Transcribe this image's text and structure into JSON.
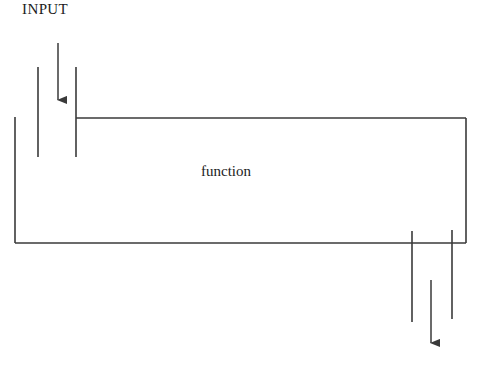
{
  "canvas": {
    "width": 481,
    "height": 378,
    "background": "#ffffff"
  },
  "style": {
    "stroke_color": "#3a3a3a",
    "text_color": "#1c1c1c",
    "stroke_width": 1.6
  },
  "labels": {
    "input": "INPUT",
    "function": "function"
  },
  "diagram": {
    "type": "block-flow-diagram",
    "box": {
      "name": "function-box",
      "left": 15,
      "top": 118,
      "right": 466,
      "bottom": 243
    },
    "arrows": [
      {
        "name": "input-arrow",
        "direction": "down",
        "x": 58,
        "y_start": 43,
        "y_end": 110
      },
      {
        "name": "output-arrow",
        "direction": "down",
        "x": 431,
        "y_start": 280,
        "y_end": 353
      }
    ],
    "port_lines": [
      {
        "name": "input-port-line-left",
        "x": 38,
        "y_start": 67,
        "y_end": 157
      },
      {
        "name": "input-port-line-right",
        "x": 76,
        "y_start": 67,
        "y_end": 157
      },
      {
        "name": "output-port-line-left",
        "x": 412,
        "y_start": 231,
        "y_end": 322
      },
      {
        "name": "output-port-line-right",
        "x": 452,
        "y_start": 230,
        "y_end": 319
      }
    ]
  }
}
